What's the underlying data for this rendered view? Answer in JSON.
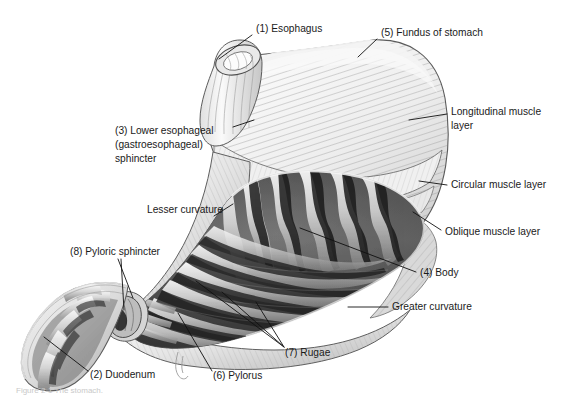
{
  "figure": {
    "caption_partial": "Figure 2-1  The stomach.",
    "background_color": "#ffffff",
    "line_color": "#111111",
    "text_color": "#1a1a1a"
  },
  "labels": [
    {
      "id": "esophagus",
      "number": "(1)",
      "text": "(1) Esophagus",
      "lines": [
        "(1) Esophagus"
      ],
      "x": 256,
      "y": 29,
      "anchor": "start"
    },
    {
      "id": "fundus",
      "number": "(5)",
      "text": "(5) Fundus of stomach",
      "lines": [
        "(5) Fundus of stomach"
      ],
      "x": 381,
      "y": 33,
      "anchor": "start"
    },
    {
      "id": "longitudinal-muscle-layer",
      "number": "",
      "text": "Longitudinal muscle layer",
      "lines": [
        "Longitudinal muscle",
        "layer"
      ],
      "x": 451,
      "y": 115,
      "anchor": "start"
    },
    {
      "id": "lower-esophageal-sphincter",
      "number": "(3)",
      "text": "(3) Lower esophageal (gastroesophageal) sphincter",
      "lines": [
        "(3) Lower esophageal",
        "(gastroesophageal)",
        "sphincter"
      ],
      "x": 115,
      "y": 130,
      "anchor": "start"
    },
    {
      "id": "circular-muscle-layer",
      "number": "",
      "text": "Circular muscle layer",
      "lines": [
        "Circular muscle layer"
      ],
      "x": 451,
      "y": 185,
      "anchor": "start"
    },
    {
      "id": "lesser-curvature",
      "number": "",
      "text": "Lesser curvature",
      "lines": [
        "Lesser curvature"
      ],
      "x": 147,
      "y": 210,
      "anchor": "start"
    },
    {
      "id": "oblique-muscle-layer",
      "number": "",
      "text": "Oblique muscle layer",
      "lines": [
        "Oblique muscle layer"
      ],
      "x": 445,
      "y": 232,
      "anchor": "start"
    },
    {
      "id": "pyloric-sphincter",
      "number": "(8)",
      "text": "(8) Pyloric sphincter",
      "lines": [
        "(8) Pyloric sphincter"
      ],
      "x": 70,
      "y": 252,
      "anchor": "start"
    },
    {
      "id": "body",
      "number": "(4)",
      "text": "(4) Body",
      "lines": [
        "(4) Body"
      ],
      "x": 420,
      "y": 273,
      "anchor": "start"
    },
    {
      "id": "greater-curvature",
      "number": "",
      "text": "Greater curvature",
      "lines": [
        "Greater curvature"
      ],
      "x": 392,
      "y": 307,
      "anchor": "start"
    },
    {
      "id": "rugae",
      "number": "(7)",
      "text": "(7) Rugae",
      "lines": [
        "(7) Rugae"
      ],
      "x": 285,
      "y": 353,
      "anchor": "start"
    },
    {
      "id": "pylorus",
      "number": "(6)",
      "text": "(6) Pylorus",
      "lines": [
        "(6) Pylorus"
      ],
      "x": 213,
      "y": 376,
      "anchor": "start"
    },
    {
      "id": "duodenum",
      "number": "(2)",
      "text": "(2) Duodenum",
      "lines": [
        "(2) Duodenum"
      ],
      "x": 90,
      "y": 375,
      "anchor": "start"
    }
  ],
  "structures": [
    {
      "id": "esophagus-tube",
      "name": "Esophagus"
    },
    {
      "id": "fundus-dome",
      "name": "Fundus of stomach"
    },
    {
      "id": "stomach-body",
      "name": "Body of stomach"
    },
    {
      "id": "rugae-folds",
      "name": "Rugae (gastric folds)"
    },
    {
      "id": "pylorus-region",
      "name": "Pylorus"
    },
    {
      "id": "pyloric-sphincter-ring",
      "name": "Pyloric sphincter"
    },
    {
      "id": "duodenum-curve",
      "name": "Duodenum"
    },
    {
      "id": "muscle-layers",
      "name": "Muscle layers (longitudinal, circular, oblique)"
    }
  ]
}
